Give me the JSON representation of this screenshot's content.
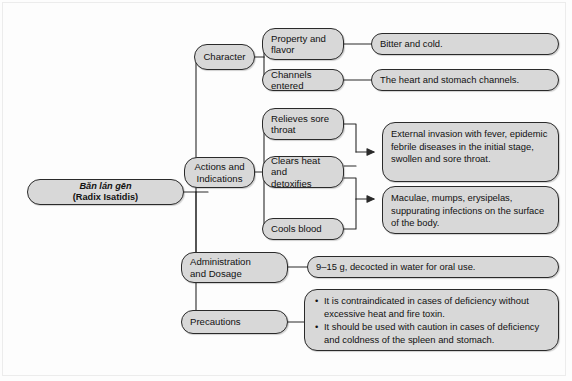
{
  "diagram": {
    "type": "mind-map",
    "title": "Bǎn lán gēn (Radix Isatidis)",
    "root": {
      "pinyin": "Bǎn lán gēn",
      "latin": "(Radix Isatidis)"
    },
    "branches": {
      "character": "Character",
      "actions": "Actions and\nIndications",
      "administration": "Administration\nand Dosage",
      "precautions": "Precautions"
    },
    "character_children": {
      "property_flavor": "Property and\nflavor",
      "channels_entered": "Channels entered"
    },
    "character_values": {
      "property_flavor": "Bitter and cold.",
      "channels_entered": "The heart and stomach channels."
    },
    "actions_children": {
      "relieves": "Relieves sore\nthroat",
      "clears": "Clears heat and\ndetoxifies",
      "cools": "Cools blood"
    },
    "indication_texts": {
      "first": "External invasion with fever, epidemic febrile diseases in the initial stage, swollen and sore throat.",
      "second": "Maculae, mumps, erysipelas, suppurating infections on the surface of the body."
    },
    "administration_value": "9–15 g, decocted in water for oral use.",
    "precautions_items": [
      "It is contraindicated in cases of deficiency without excessive heat and fire toxin.",
      "It should be used with caution in cases of deficiency and coldness of the spleen and stomach."
    ]
  },
  "colors": {
    "node_fill": "#d8d8d8",
    "node_border": "#2a2a2a",
    "page_background": "#fdfdfd",
    "text": "#111111"
  }
}
